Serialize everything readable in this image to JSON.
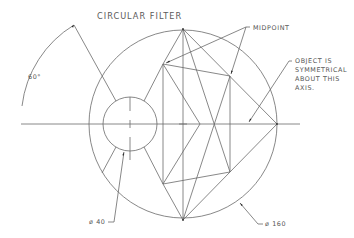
{
  "title": "CIRCULAR FILTER",
  "labels": {
    "angle": "60°",
    "midpoint": "MIDPOINT",
    "note_line1": "OBJECT IS",
    "note_line2": "SYMMETRICAL",
    "note_line3": "ABOUT THIS",
    "note_line4": "AXIS.",
    "small_diameter": "ø 40",
    "large_diameter": "ø 160"
  },
  "geometry": {
    "large_circle": {
      "cx": 183,
      "cy": 124,
      "r": 94,
      "diameter": 160
    },
    "small_circle": {
      "cx": 130,
      "cy": 124,
      "r": 27,
      "diameter": 40
    },
    "angle_deg": 60
  },
  "colors": {
    "line": "#6a6a6a",
    "text": "#555555",
    "arrow": "#222222",
    "background": "#ffffff"
  }
}
